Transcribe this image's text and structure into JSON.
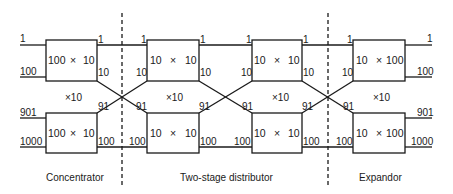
{
  "diagram": {
    "inputs": {
      "top_first": "1",
      "top_last": "100",
      "bottom_first": "901",
      "bottom_last": "1000"
    },
    "outputs": {
      "top_first": "1",
      "top_last": "100",
      "bottom_first": "901",
      "bottom_last": "1000"
    },
    "stages": [
      {
        "name": "Concentrator",
        "box_label_left": "100",
        "box_label_op": "×",
        "box_label_right": "10",
        "multiplier": "×10",
        "out_top_first": "1",
        "out_top_last": "10",
        "out_bottom_first": "91",
        "out_bottom_last": "100"
      },
      {
        "name": "Two-stage distributor stage 1",
        "box_label_left": "10",
        "box_label_op": "×",
        "box_label_right": "10",
        "multiplier": "×10",
        "in_top_first": "1",
        "in_top_last": "10",
        "in_bottom_first": "91",
        "in_bottom_last": "100",
        "out_top_first": "1",
        "out_top_last": "10",
        "out_bottom_first": "91",
        "out_bottom_last": "100"
      },
      {
        "name": "Two-stage distributor stage 2",
        "box_label_left": "10",
        "box_label_op": "×",
        "box_label_right": "10",
        "multiplier": "×10",
        "in_top_first": "1",
        "in_top_last": "10",
        "in_bottom_first": "91",
        "in_bottom_last": "100",
        "out_top_first": "1",
        "out_top_last": "10",
        "out_bottom_first": "91",
        "out_bottom_last": "100"
      },
      {
        "name": "Expandor",
        "box_label_left": "10",
        "box_label_op": "×",
        "box_label_right": "100",
        "multiplier": "×10",
        "in_top_first": "1",
        "in_top_last": "10",
        "in_bottom_first": "91",
        "in_bottom_last": "100"
      }
    ],
    "section_labels": {
      "concentrator": "Concentrator",
      "distributor": "Two-stage distributor",
      "expandor": "Expandor"
    },
    "colors": {
      "line": "#1a1a1a",
      "background": "#ffffff"
    }
  }
}
